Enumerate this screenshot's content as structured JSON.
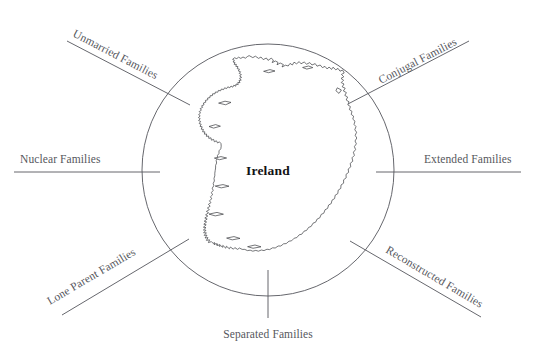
{
  "diagram": {
    "center": {
      "label": "Ireland",
      "shape": "ireland-map-outline"
    },
    "colors": {
      "line": "#55565c",
      "label_text": "#56575d",
      "center_text": "#121214",
      "map_stroke": "#3b3c40",
      "background": "#ffffff"
    },
    "hub": {
      "cx": 268,
      "cy": 170,
      "r": 126
    },
    "spokes": [
      {
        "id": "unmarried-families",
        "label": "Unmarried Families",
        "position": "top-left",
        "rotation": -27.5,
        "line": {
          "x1": 67,
          "y1": 41,
          "x2": 190,
          "y2": 105
        },
        "text": {
          "x": 72,
          "y": 36
        }
      },
      {
        "id": "conjugal-families",
        "label": "Conjugal Families",
        "position": "top-right",
        "rotation": -27.5,
        "line": {
          "x1": 346,
          "y1": 105,
          "x2": 469,
          "y2": 41
        },
        "text": {
          "x": 381,
          "y": 84
        }
      },
      {
        "id": "nuclear-families",
        "label": "Nuclear Families",
        "position": "left",
        "rotation": 0,
        "line": {
          "x1": 14,
          "y1": 172,
          "x2": 160,
          "y2": 172
        },
        "text": {
          "x": 20,
          "y": 163
        }
      },
      {
        "id": "extended-families",
        "label": "Extended Families",
        "position": "right",
        "rotation": 0,
        "line": {
          "x1": 376,
          "y1": 172,
          "x2": 521,
          "y2": 172
        },
        "text": {
          "x": 424,
          "y": 163
        }
      },
      {
        "id": "lone-parent-families",
        "label": "Lone Parent Families",
        "position": "bottom-left",
        "rotation": 27.5,
        "line": {
          "x1": 62,
          "y1": 315,
          "x2": 189,
          "y2": 239
        },
        "text": {
          "x": 50,
          "y": 305
        }
      },
      {
        "id": "reconstructed-families",
        "label": "Reconstructed Families",
        "position": "bottom-right",
        "rotation": 27.5,
        "line": {
          "x1": 350,
          "y1": 241,
          "x2": 481,
          "y2": 317
        },
        "text": {
          "x": 385,
          "y": 252
        }
      },
      {
        "id": "separated-families",
        "label": "Separated Families",
        "position": "bottom",
        "rotation": 0,
        "line": {
          "x1": 268,
          "y1": 270,
          "x2": 268,
          "y2": 318
        },
        "text": {
          "x": 268,
          "y": 338
        }
      }
    ]
  }
}
